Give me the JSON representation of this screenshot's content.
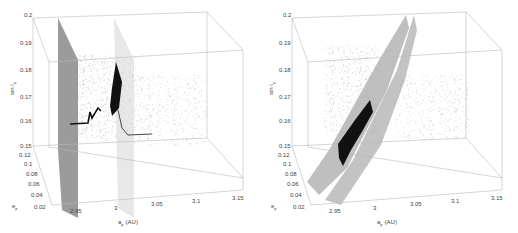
{
  "chart_data": [
    {
      "type": "scatter",
      "subtype": "3d-scatter",
      "panel": "left",
      "title": "",
      "xlabel": "a_p (AU)",
      "ylabel": "e_p",
      "zlabel": "sin i_p",
      "x_ticks": [
        "2.95",
        "3",
        "3.05",
        "3.1",
        "3.15"
      ],
      "y_ticks": [
        "0.02",
        "0.04",
        "0.06",
        "0.08",
        "0.1",
        "0.12"
      ],
      "z_ticks": [
        "0.15",
        "0.16",
        "0.17",
        "0.18",
        "0.19",
        "0.2"
      ],
      "xlim": [
        2.92,
        3.15
      ],
      "ylim": [
        0.02,
        0.12
      ],
      "zlim": [
        0.15,
        0.2
      ],
      "grid": true,
      "series": [
        {
          "name": "background asteroids",
          "style": "light grey dots",
          "description": "diffuse cloud spread across a_p 2.95–3.12, sin i_p 0.155–0.19"
        },
        {
          "name": "resonance plane 1",
          "style": "dark grey vertical plane",
          "a_p": 2.93
        },
        {
          "name": "resonance plane 2",
          "style": "light grey vertical plane",
          "a_p": 3.0
        },
        {
          "name": "family members",
          "style": "black dense points",
          "description": "compact cluster near a_p≈3.0, sin i_p 0.163–0.178 with short chains toward lower a_p and toward a_p≈3.05 at sin i_p≈0.157"
        }
      ]
    },
    {
      "type": "scatter",
      "subtype": "3d-scatter",
      "panel": "right",
      "title": "",
      "xlabel": "a_p (AU)",
      "ylabel": "e_p",
      "zlabel": "sin i_p",
      "x_ticks": [
        "2.95",
        "3",
        "3.05",
        "3.1",
        "3.15"
      ],
      "y_ticks": [
        "0.02",
        "0.04",
        "0.06",
        "0.08",
        "0.1",
        "0.12"
      ],
      "z_ticks": [
        "0.15",
        "0.16",
        "0.17",
        "0.18",
        "0.19",
        "0.2"
      ],
      "xlim": [
        2.92,
        3.15
      ],
      "ylim": [
        0.02,
        0.12
      ],
      "zlim": [
        0.15,
        0.2
      ],
      "grid": true,
      "series": [
        {
          "name": "background asteroids",
          "style": "light grey dots",
          "description": "diffuse cloud spread across a_p 2.95–3.12, sin i_p 0.155–0.19"
        },
        {
          "name": "secular resonance surface 1",
          "style": "grey inclined surface",
          "description": "rises diagonally from low a_p/low sin i_p to a_p≈3.02, sin i_p 0.2"
        },
        {
          "name": "secular resonance surface 2",
          "style": "grey inclined surface",
          "description": "parallel surface slightly offset toward higher a_p"
        },
        {
          "name": "family members",
          "style": "black dense points",
          "description": "elongated cluster between the surfaces, a_p≈2.96–2.99, sin i_p 0.15–0.166"
        }
      ]
    }
  ],
  "labels": {
    "z_axis": "sin i",
    "z_sub": "p",
    "y_axis": "e",
    "y_sub": "p",
    "x_axis": "a",
    "x_sub": "p",
    "x_unit": "(AU)"
  },
  "colors": {
    "box": "#b8b8b8",
    "grid": "#e2e2e2",
    "dots": "#9a9a9a",
    "plane_dark": "#8a8a8a",
    "plane_light": "#dcdcdc",
    "surface": "#a9a9a9",
    "family": "#111111"
  }
}
